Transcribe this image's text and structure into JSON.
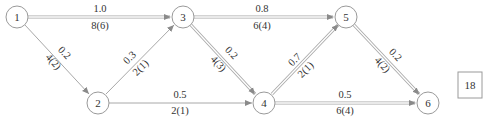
{
  "diagram": {
    "type": "network",
    "nodes": [
      {
        "id": "1",
        "label": "1",
        "x": 17,
        "y": 17
      },
      {
        "id": "2",
        "label": "2",
        "x": 98,
        "y": 103
      },
      {
        "id": "3",
        "label": "3",
        "x": 183,
        "y": 17
      },
      {
        "id": "4",
        "label": "4",
        "x": 264,
        "y": 103
      },
      {
        "id": "5",
        "label": "5",
        "x": 346,
        "y": 17
      },
      {
        "id": "6",
        "label": "6",
        "x": 428,
        "y": 103
      }
    ],
    "edges": [
      {
        "from": "1",
        "to": "3",
        "top": "1.0",
        "bottom": "8(6)",
        "style": "double"
      },
      {
        "from": "1",
        "to": "2",
        "top": "0.2",
        "bottom": "4(2)",
        "style": "single"
      },
      {
        "from": "2",
        "to": "3",
        "top": "0.3",
        "bottom": "2(1)",
        "style": "single"
      },
      {
        "from": "2",
        "to": "4",
        "top": "0.5",
        "bottom": "2(1)",
        "style": "single"
      },
      {
        "from": "3",
        "to": "5",
        "top": "0.8",
        "bottom": "6(4)",
        "style": "double"
      },
      {
        "from": "3",
        "to": "4",
        "top": "0.2",
        "bottom": "4(3)",
        "style": "double"
      },
      {
        "from": "4",
        "to": "5",
        "top": "0.7",
        "bottom": "2(1)",
        "style": "double"
      },
      {
        "from": "4",
        "to": "6",
        "top": "0.5",
        "bottom": "6(4)",
        "style": "double"
      },
      {
        "from": "5",
        "to": "6",
        "top": "0.2",
        "bottom": "4(2)",
        "style": "double"
      }
    ],
    "result_box": {
      "value": "18"
    }
  },
  "labels": {
    "n1": "1",
    "n2": "2",
    "n3": "3",
    "n4": "4",
    "n5": "5",
    "n6": "6",
    "e13_top": "1.0",
    "e13_bot": "8(6)",
    "e12_top": "0.2",
    "e12_bot": "4(2)",
    "e23_top": "0.3",
    "e23_bot": "2(1)",
    "e24_top": "0.5",
    "e24_bot": "2(1)",
    "e35_top": "0.8",
    "e35_bot": "6(4)",
    "e34_top": "0.2",
    "e34_bot": "4(3)",
    "e45_top": "0.7",
    "e45_bot": "2(1)",
    "e46_top": "0.5",
    "e46_bot": "6(4)",
    "e56_top": "0.2",
    "e56_bot": "4(2)",
    "box": "18"
  },
  "colors": {
    "line": "#a8a8a8",
    "node_stroke": "#9a9a9a",
    "text": "#333333"
  }
}
